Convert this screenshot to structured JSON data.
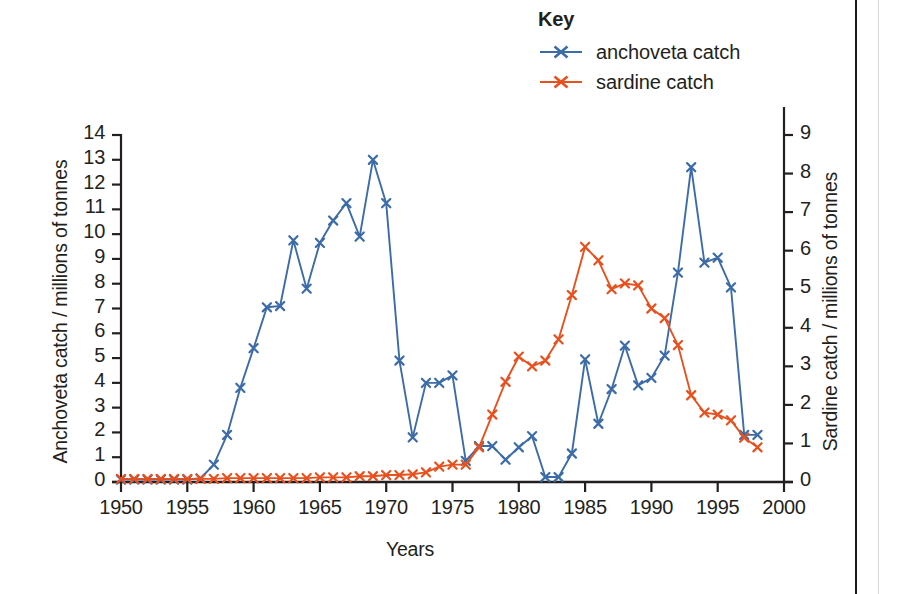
{
  "legend": {
    "title": "Key",
    "entries": [
      {
        "label": "anchoveta catch",
        "color": "#3c6ca8",
        "marker": "x-marker-icon"
      },
      {
        "label": "sardine catch",
        "color": "#e8501e",
        "marker": "x-marker-icon"
      }
    ]
  },
  "axes": {
    "x_title": "Years",
    "y_left_title": "Anchoveta catch / millions of tonnes",
    "y_right_title": "Sardine catch / millions of tonnes",
    "x_ticks": [
      "1950",
      "1955",
      "1960",
      "1965",
      "1970",
      "1975",
      "1980",
      "1985",
      "1990",
      "1995",
      "2000"
    ],
    "y_left_ticks": [
      "14",
      "13",
      "12",
      "11",
      "10",
      "9",
      "8",
      "7",
      "6",
      "5",
      "4",
      "3",
      "2",
      "1",
      "0"
    ],
    "y_right_ticks": [
      "9",
      "8",
      "7",
      "6",
      "5",
      "4",
      "3",
      "2",
      "1",
      "0"
    ]
  },
  "chart_data": {
    "type": "line",
    "title": "",
    "xlabel": "Years",
    "ylabel": "Anchoveta catch / millions of tonnes",
    "y2label": "Sardine catch / millions of tonnes",
    "xlim": [
      1950,
      2000
    ],
    "ylim": [
      0,
      14
    ],
    "y2lim": [
      0,
      9
    ],
    "grid": false,
    "legend_position": "top-right",
    "x": [
      1950,
      1951,
      1952,
      1953,
      1954,
      1955,
      1956,
      1957,
      1958,
      1959,
      1960,
      1961,
      1962,
      1963,
      1964,
      1965,
      1966,
      1967,
      1968,
      1969,
      1970,
      1971,
      1972,
      1973,
      1974,
      1975,
      1976,
      1977,
      1978,
      1979,
      1980,
      1981,
      1982,
      1983,
      1984,
      1985,
      1986,
      1987,
      1988,
      1989,
      1990,
      1991,
      1992,
      1993,
      1994,
      1995,
      1996,
      1997,
      1998
    ],
    "series": [
      {
        "name": "anchoveta catch",
        "axis": "left",
        "color": "#3c6ca8",
        "marker": "x",
        "units": "millions of tonnes",
        "values": [
          0.1,
          0.1,
          0.1,
          0.1,
          0.1,
          0.1,
          0.15,
          0.7,
          1.9,
          3.8,
          5.4,
          7.05,
          7.1,
          9.75,
          7.8,
          9.65,
          10.55,
          11.25,
          9.9,
          13.0,
          11.25,
          4.9,
          1.8,
          4.0,
          4.0,
          4.3,
          0.85,
          1.45,
          1.45,
          0.9,
          1.4,
          1.85,
          0.2,
          0.2,
          1.15,
          4.95,
          2.35,
          3.75,
          5.5,
          3.9,
          4.2,
          5.1,
          8.45,
          12.7,
          8.85,
          9.05,
          7.85,
          1.9,
          1.9
        ]
      },
      {
        "name": "sardine catch",
        "axis": "right",
        "color": "#e8501e",
        "marker": "x",
        "units": "millions of tonnes",
        "values": [
          0.08,
          0.08,
          0.08,
          0.08,
          0.08,
          0.08,
          0.08,
          0.08,
          0.1,
          0.1,
          0.1,
          0.1,
          0.1,
          0.1,
          0.1,
          0.12,
          0.12,
          0.12,
          0.15,
          0.15,
          0.18,
          0.18,
          0.2,
          0.25,
          0.4,
          0.45,
          0.45,
          0.9,
          1.75,
          2.6,
          3.25,
          3.0,
          3.15,
          3.7,
          4.85,
          6.1,
          5.75,
          5.0,
          5.15,
          5.1,
          4.5,
          4.25,
          3.55,
          2.25,
          1.8,
          1.75,
          1.6,
          1.15,
          0.9
        ]
      }
    ]
  }
}
